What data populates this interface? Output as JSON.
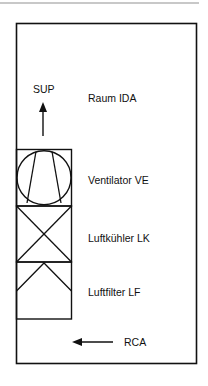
{
  "diagram": {
    "type": "air-handling-unit-schematic",
    "room_label": "Raum IDA",
    "supply_label": "SUP",
    "return_label": "RCA",
    "components": [
      {
        "id": "VE",
        "label": "Ventilator VE",
        "symbol": "fan"
      },
      {
        "id": "LK",
        "label": "Luftkühler LK",
        "symbol": "cooler-cross"
      },
      {
        "id": "LF",
        "label": "Luftfilter LF",
        "symbol": "filter-chevron"
      }
    ],
    "flows": [
      {
        "label": "SUP",
        "direction": "up"
      },
      {
        "label": "RCA",
        "direction": "left"
      }
    ]
  }
}
